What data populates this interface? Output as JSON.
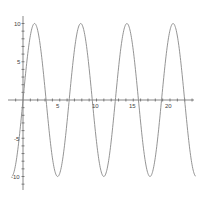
{
  "chart_data": {
    "type": "line",
    "title": "",
    "xlabel": "",
    "ylabel": "",
    "function": "y = 10*sin(x)",
    "xlim": [
      -1.5,
      23.5
    ],
    "ylim": [
      -12,
      11
    ],
    "x_ticks": [
      5,
      10,
      15,
      20
    ],
    "y_ticks": [
      -10,
      -5,
      5,
      10
    ],
    "grid": false,
    "legend": null,
    "series": [
      {
        "name": "10 sin(x)",
        "color": "#888888",
        "x": [
          -1.5,
          0,
          1.571,
          3.142,
          4.712,
          6.283,
          7.854,
          9.425,
          10.996,
          12.566,
          14.137,
          15.708,
          17.279,
          18.85,
          20.42,
          21.991,
          23.5
        ],
        "y": [
          -9.97,
          0,
          10,
          0,
          -10,
          0,
          10,
          0,
          -10,
          0,
          10,
          0,
          -10,
          0,
          10,
          0,
          -9.99
        ]
      }
    ]
  },
  "axis": {
    "x_labels": [
      "5",
      "10",
      "15",
      "20"
    ],
    "y_labels": [
      "10",
      "5",
      "-5",
      "-10"
    ]
  },
  "colors": {
    "curve": "#888888",
    "axis": "#555555"
  }
}
